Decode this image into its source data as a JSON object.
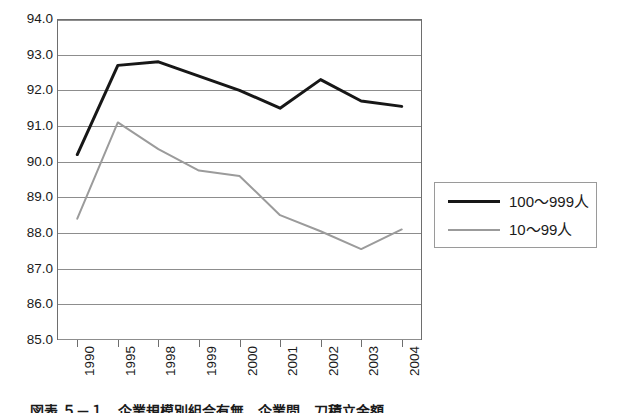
{
  "chart_data": {
    "type": "line",
    "title": "",
    "subtitle": "",
    "xlabel": "",
    "ylabel": "",
    "categories": [
      "1990",
      "1995",
      "1998",
      "1999",
      "2000",
      "2001",
      "2002",
      "2003",
      "2004"
    ],
    "ylim": [
      85.0,
      94.0
    ],
    "ytick_step": 1.0,
    "ytick_labels": [
      "94.0",
      "93.0",
      "92.0",
      "91.0",
      "90.0",
      "89.0",
      "88.0",
      "87.0",
      "86.0",
      "85.0"
    ],
    "ytick_values": [
      94.0,
      93.0,
      92.0,
      91.0,
      90.0,
      89.0,
      88.0,
      87.0,
      86.0,
      85.0
    ],
    "grid": true,
    "grid_axis": "y",
    "legend_position": "right",
    "series": [
      {
        "name": "100〜999人",
        "color": "#171717",
        "line_width": 3,
        "values": [
          90.2,
          92.7,
          92.8,
          92.4,
          92.0,
          91.5,
          92.3,
          91.7,
          91.55
        ]
      },
      {
        "name": "10〜99人",
        "color": "#9b9b9b",
        "line_width": 2,
        "values": [
          88.4,
          91.1,
          90.35,
          89.75,
          89.6,
          88.5,
          88.05,
          87.55,
          88.1
        ]
      }
    ]
  },
  "legend": {
    "items": [
      {
        "label": "100〜999人",
        "swatch": "dark"
      },
      {
        "label": "10〜99人",
        "swatch": "gray"
      }
    ]
  },
  "caption": {
    "text": "図表 ５－１　企業規模別組合有無　企業間　刀積立金額"
  }
}
